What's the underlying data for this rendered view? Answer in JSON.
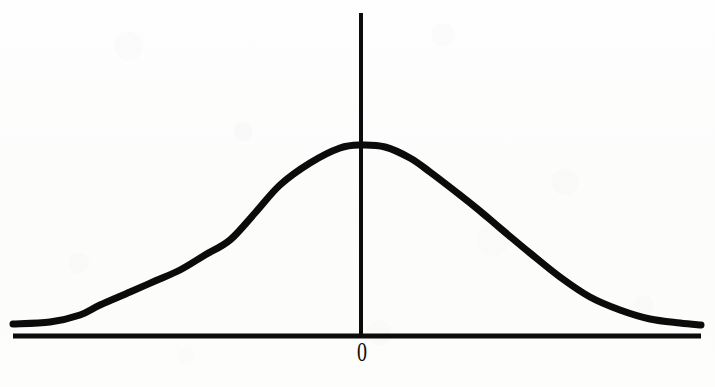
{
  "figure": {
    "kind": "bell-curve-diagram",
    "background_color": "#fdfdfc",
    "ink_color": "#0c0c0c",
    "width": 715,
    "height": 387
  },
  "axes": {
    "x_axis": {
      "name": "horizontal-axis",
      "label": "",
      "x_start": 13,
      "x_end": 701,
      "y": 336,
      "thickness": 5
    },
    "y_axis": {
      "name": "vertical-axis",
      "label": "",
      "x": 361,
      "y_top": 13,
      "y_bottom": 336,
      "thickness": 4
    }
  },
  "tick_labels": {
    "zero": {
      "text": "0",
      "x": 362,
      "y": 353
    }
  },
  "chart_data": {
    "type": "line",
    "title": "",
    "subtitle": "",
    "xlabel": "",
    "ylabel": "",
    "grid": false,
    "legend": null,
    "annotations": [
      {
        "text": "0",
        "x": 0,
        "y": 0,
        "position": "below-x-axis-at-origin"
      }
    ],
    "curve_name": "normal-distribution",
    "distribution": {
      "family": "gaussian",
      "mean": 0,
      "std_dev": 1,
      "peak_pixel": {
        "x": 361,
        "y": 145
      },
      "baseline_pixel_y": 324,
      "stroke_width": 7
    },
    "axis_ranges": {
      "x_pixel": [
        13,
        701
      ],
      "y_pixel": [
        145,
        336
      ],
      "xlim": [
        -3.75,
        3.75
      ],
      "ylim": [
        0,
        1
      ]
    },
    "x": [
      -3.75,
      -3.4,
      -3.05,
      -2.7,
      -2.35,
      -2.0,
      -1.65,
      -1.3,
      -0.95,
      -0.6,
      -0.25,
      0.0,
      0.25,
      0.6,
      0.95,
      1.3,
      1.65,
      2.0,
      2.35,
      2.7,
      3.05,
      3.4,
      3.75
    ],
    "y": [
      0.009,
      0.018,
      0.035,
      0.066,
      0.119,
      0.199,
      0.303,
      0.424,
      0.55,
      0.67,
      0.77,
      0.8,
      0.77,
      0.67,
      0.55,
      0.424,
      0.303,
      0.199,
      0.119,
      0.066,
      0.035,
      0.018,
      0.009
    ],
    "pixel_points": [
      {
        "x": 13,
        "y": 324
      },
      {
        "x": 50,
        "y": 322
      },
      {
        "x": 80,
        "y": 315
      },
      {
        "x": 100,
        "y": 305
      },
      {
        "x": 130,
        "y": 292
      },
      {
        "x": 155,
        "y": 281
      },
      {
        "x": 180,
        "y": 270
      },
      {
        "x": 205,
        "y": 255
      },
      {
        "x": 230,
        "y": 240
      },
      {
        "x": 255,
        "y": 213
      },
      {
        "x": 280,
        "y": 185
      },
      {
        "x": 310,
        "y": 163
      },
      {
        "x": 340,
        "y": 148
      },
      {
        "x": 361,
        "y": 145
      },
      {
        "x": 385,
        "y": 147
      },
      {
        "x": 410,
        "y": 158
      },
      {
        "x": 430,
        "y": 172
      },
      {
        "x": 460,
        "y": 195
      },
      {
        "x": 480,
        "y": 211
      },
      {
        "x": 500,
        "y": 228
      },
      {
        "x": 530,
        "y": 253
      },
      {
        "x": 560,
        "y": 277
      },
      {
        "x": 590,
        "y": 297
      },
      {
        "x": 620,
        "y": 310
      },
      {
        "x": 650,
        "y": 319
      },
      {
        "x": 680,
        "y": 323
      },
      {
        "x": 701,
        "y": 325
      }
    ]
  }
}
